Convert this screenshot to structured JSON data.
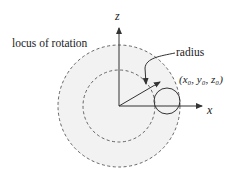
{
  "diagram": {
    "labels": {
      "locus": "locus of rotation",
      "radius": "radius",
      "point": "(x₀, y₀, z₀)",
      "z_axis": "z",
      "x_axis": "x"
    },
    "colors": {
      "ink": "#333333",
      "fill": "#f2f2f2",
      "dash": "#555555"
    }
  }
}
